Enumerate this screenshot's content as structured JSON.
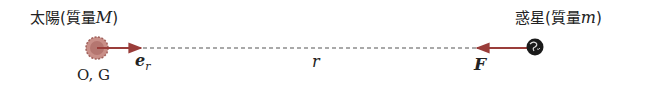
{
  "sun": {
    "label_name": "太陽",
    "label_paren_open": "(",
    "label_mass_word": "質量",
    "label_mass_symbol": "M",
    "label_paren_close": ")",
    "origin_label": "O, G",
    "color": "#b5706a"
  },
  "planet": {
    "label_name": "惑星",
    "label_paren_open": "(",
    "label_mass_word": "質量",
    "label_mass_symbol": "m",
    "label_paren_close": ")",
    "color": "#1a1a1a"
  },
  "unit_vector": {
    "symbol": "e",
    "subscript": "r",
    "color": "#9a3d3a"
  },
  "force": {
    "symbol": "F",
    "color": "#9a3d3a"
  },
  "distance": {
    "symbol": "r"
  }
}
